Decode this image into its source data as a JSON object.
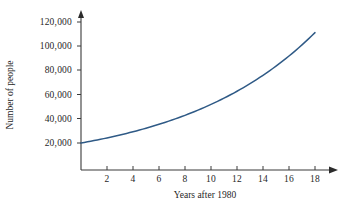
{
  "chart_data": {
    "type": "line",
    "title": "",
    "subtitle": "",
    "xlabel": "Years after 1980",
    "ylabel": "Number of people",
    "xlim": [
      0,
      20
    ],
    "ylim": [
      0,
      125000
    ],
    "grid": false,
    "legend": "none",
    "annotations": [],
    "xticks": [
      2,
      4,
      6,
      8,
      10,
      12,
      14,
      16,
      18
    ],
    "xtick_labels": [
      "2",
      "4",
      "6",
      "8",
      "10",
      "12",
      "14",
      "16",
      "18"
    ],
    "yticks": [
      20000,
      40000,
      60000,
      80000,
      100000,
      120000
    ],
    "ytick_labels": [
      "20,000",
      "40,000",
      "60,000",
      "80,000",
      "100,000",
      "120,000"
    ],
    "series": [
      {
        "name": "Number of people",
        "color": "#2f5a86",
        "model": "20000 * 1.10^x",
        "x": [
          0,
          1,
          2,
          3,
          4,
          5,
          6,
          7,
          8,
          9,
          10,
          11,
          12,
          13,
          14,
          15,
          16,
          17,
          18
        ],
        "values": [
          20000,
          22000,
          24200,
          26620,
          29282,
          32210,
          35431,
          38974,
          42872,
          47159,
          51875,
          57062,
          62769,
          69046,
          75949,
          83545,
          91899,
          101089,
          111198
        ]
      }
    ]
  },
  "axes": {
    "y_title": "Number of people",
    "x_title": "Years after 1980",
    "y_labels": [
      "120,000",
      "100,000",
      "80,000",
      "60,000",
      "40,000",
      "20,000"
    ],
    "x_labels": [
      "2",
      "4",
      "6",
      "8",
      "10",
      "12",
      "14",
      "16",
      "18"
    ]
  },
  "style": {
    "curve_color": "#2f5a86",
    "axis_color": "#3a3a3a",
    "background": "#ffffff"
  }
}
